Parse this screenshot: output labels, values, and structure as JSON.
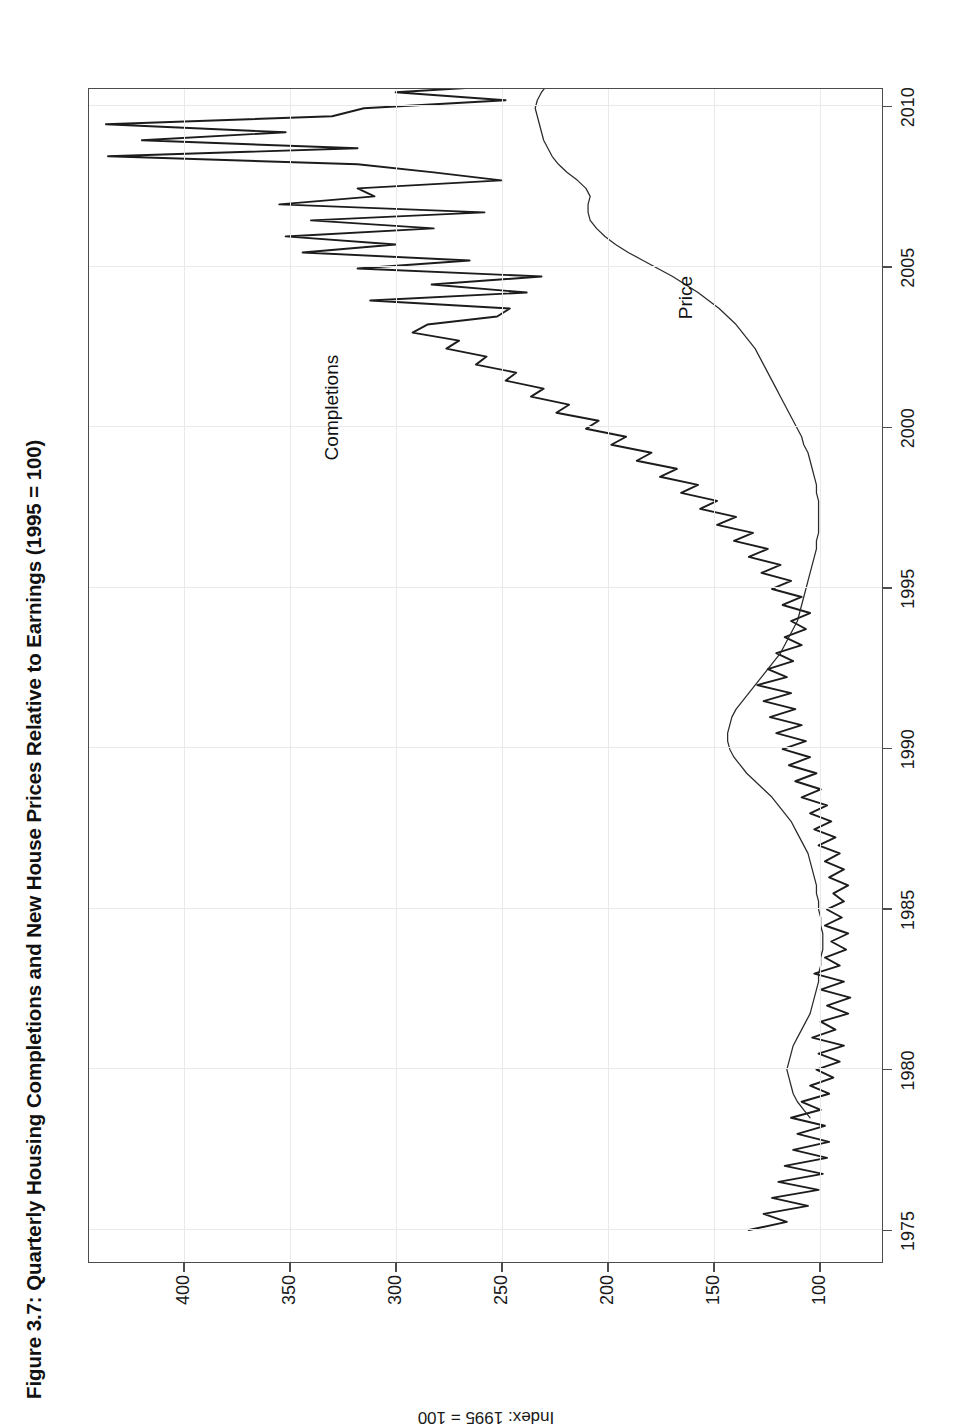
{
  "figure": {
    "title": "Figure 3.7: Quarterly Housing Completions and New House Prices Relative to Earnings (1995 = 100)",
    "orientation": "landscape-rotated-90-ccw"
  },
  "annotations": {
    "completions_label": "Completions",
    "price_label": "Price"
  },
  "chart_data": {
    "type": "line",
    "title": "Figure 3.7: Quarterly Housing Completions and New House Prices Relative to Earnings (1995 = 100)",
    "xlabel": "",
    "ylabel": "Index: 1995 = 100",
    "xlim": [
      1974.0,
      2010.6
    ],
    "ylim": [
      70,
      445
    ],
    "xticks": [
      1975,
      1980,
      1985,
      1990,
      1995,
      2000,
      2005,
      2010
    ],
    "xticklabels": [
      "1975",
      "1980",
      "1985",
      "1990",
      "1995",
      "2000",
      "2005",
      "2010"
    ],
    "yticks": [
      100,
      150,
      200,
      250,
      300,
      350,
      400
    ],
    "yticklabels": [
      "100",
      "150",
      "200",
      "250",
      "300",
      "350",
      "400"
    ],
    "grid": true,
    "legend": "inline-annotations",
    "series": [
      {
        "name": "Completions",
        "color": "#1c1c1c",
        "x_start": 1975.0,
        "x_step": 0.25,
        "values": [
          133,
          115,
          126,
          105,
          122,
          100,
          119,
          98,
          116,
          96,
          112,
          95,
          110,
          97,
          113,
          99,
          108,
          95,
          104,
          93,
          101,
          90,
          100,
          88,
          103,
          92,
          99,
          86,
          96,
          85,
          99,
          88,
          102,
          90,
          97,
          87,
          94,
          86,
          97,
          89,
          96,
          88,
          93,
          86,
          95,
          88,
          97,
          90,
          100,
          92,
          102,
          94,
          104,
          96,
          108,
          99,
          111,
          101,
          114,
          104,
          117,
          106,
          120,
          108,
          123,
          111,
          126,
          113,
          129,
          115,
          124,
          112,
          120,
          108,
          116,
          106,
          113,
          104,
          117,
          108,
          122,
          113,
          127,
          118,
          133,
          124,
          140,
          131,
          148,
          139,
          156,
          148,
          165,
          157,
          175,
          167,
          186,
          179,
          198,
          191,
          210,
          204,
          224,
          218,
          236,
          230,
          248,
          243,
          262,
          257,
          276,
          270,
          292,
          285,
          252,
          246,
          312,
          238,
          283,
          231,
          318,
          265,
          344,
          300,
          352,
          282,
          340,
          258,
          355,
          310,
          318,
          250,
          282,
          318,
          436,
          318,
          420,
          352,
          437,
          330,
          315,
          248,
          300,
          236,
          282,
          222,
          270,
          214,
          232,
          216,
          212,
          205,
          200,
          196,
          192
        ]
      },
      {
        "name": "Price",
        "color": "#2a2a2a",
        "x_start": 1978.5,
        "x_step": 0.25,
        "values": [
          104,
          107,
          110,
          112,
          113,
          114,
          115,
          114,
          113,
          112,
          110,
          108,
          106,
          104,
          103,
          102,
          101,
          100,
          100,
          99,
          99,
          98,
          98,
          98,
          99,
          99,
          100,
          100,
          101,
          101,
          102,
          103,
          104,
          105,
          107,
          109,
          111,
          113,
          116,
          119,
          122,
          126,
          130,
          134,
          137,
          140,
          142,
          143,
          143,
          142,
          141,
          139,
          136,
          133,
          130,
          127,
          124,
          121,
          118,
          116,
          114,
          112,
          110,
          109,
          108,
          107,
          106,
          105,
          104,
          103,
          102,
          101,
          101,
          100,
          100,
          100,
          100,
          100,
          101,
          101,
          102,
          103,
          104,
          105,
          107,
          108,
          110,
          112,
          114,
          116,
          118,
          120,
          122,
          124,
          126,
          128,
          130,
          133,
          136,
          139,
          143,
          147,
          152,
          157,
          163,
          169,
          176,
          183,
          190,
          196,
          201,
          205,
          208,
          209,
          209,
          208,
          210,
          214,
          219,
          223,
          226,
          228,
          230,
          231,
          232,
          233,
          234,
          233,
          231,
          228,
          224,
          219,
          214,
          210,
          206,
          203,
          201,
          200
        ]
      }
    ]
  }
}
